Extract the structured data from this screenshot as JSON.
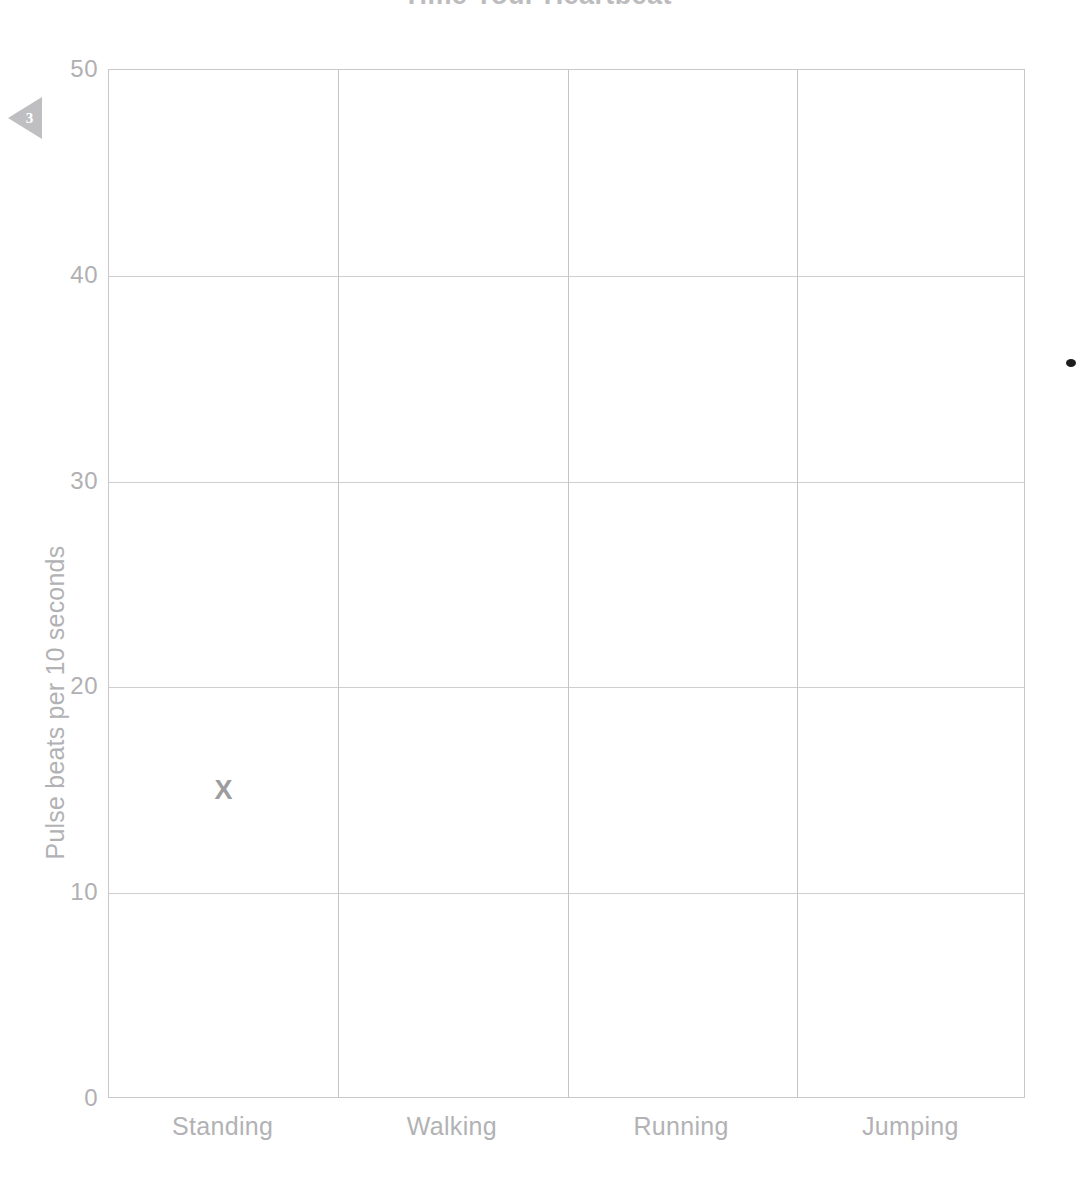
{
  "page": {
    "title": "Time Your Heartbeat",
    "marker_number": "3",
    "marker_icon": "left-triangle-icon",
    "artifact_icon": "ink-dot-icon",
    "background_color": "#ffffff"
  },
  "chart_data": {
    "type": "scatter",
    "title": "Time Your Heartbeat",
    "xlabel": "",
    "ylabel": "Pulse beats per 10 seconds",
    "categories": [
      "Standing",
      "Walking",
      "Running",
      "Jumping"
    ],
    "y_ticks": [
      0,
      10,
      20,
      30,
      40,
      50
    ],
    "y_tick_labels": [
      "0",
      "10",
      "20",
      "30",
      "40",
      "50"
    ],
    "ylim": [
      0,
      50
    ],
    "grid": true,
    "legend": "none",
    "marker_glyph": "X",
    "marker_color": "#9d9da0",
    "grid_color": "#cfcfd1",
    "axis_color": "#c9c9cb",
    "text_color": "#b2b2b5",
    "points": [
      {
        "category": "Standing",
        "value": 15,
        "label": "X"
      }
    ],
    "series": [
      {
        "name": "Pulse beats per 10 seconds",
        "values": [
          15,
          null,
          null,
          null
        ]
      }
    ]
  }
}
